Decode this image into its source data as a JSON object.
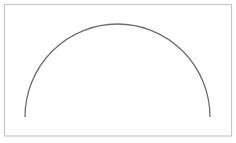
{
  "diagram": {
    "shape": "semicircle-arc",
    "frame": {
      "x": 4.5,
      "y": 4.5,
      "width": 227,
      "height": 131.5,
      "stroke": "#c8c8c8",
      "stroke_width": 1.2,
      "fill": "#ffffff"
    },
    "arc": {
      "start_x": 25,
      "start_y": 117,
      "end_x": 210,
      "end_y": 117,
      "radius_x": 92.5,
      "radius_y": 93,
      "stroke": "#6e6e6e",
      "stroke_width": 1.3
    },
    "colors": {
      "background": "#ffffff",
      "frame": "#c8c8c8",
      "arc": "#6e6e6e"
    }
  }
}
